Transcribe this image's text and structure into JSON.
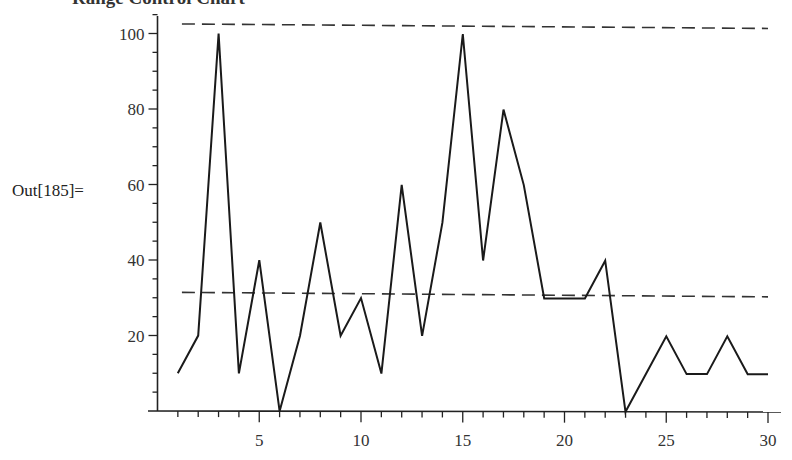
{
  "cell": {
    "output_label": "Out[185]=",
    "truncated_heading": "Range Control Chart"
  },
  "chart_data": {
    "type": "line",
    "title": "Range Control Chart",
    "xlabel": "",
    "ylabel": "",
    "x": [
      1,
      2,
      3,
      4,
      5,
      6,
      7,
      8,
      9,
      10,
      11,
      12,
      13,
      14,
      15,
      16,
      17,
      18,
      19,
      20,
      21,
      22,
      23,
      24,
      25,
      26,
      27,
      28,
      29,
      30
    ],
    "series": [
      {
        "name": "Range",
        "values": [
          10,
          20,
          100,
          10,
          40,
          0,
          20,
          50,
          20,
          30,
          10,
          60,
          20,
          50,
          100,
          40,
          80,
          60,
          30,
          30,
          30,
          40,
          0,
          10,
          20,
          10,
          10,
          20,
          10,
          10
        ],
        "style": "solid"
      }
    ],
    "reference_lines": [
      {
        "name": "Upper control limit",
        "value": 102.4,
        "style": "dashed"
      },
      {
        "name": "Center line (mean range)",
        "value": 31.3,
        "style": "dashed"
      }
    ],
    "xlim": [
      0,
      30.5
    ],
    "ylim": [
      0,
      105
    ],
    "x_ticks": [
      5,
      10,
      15,
      20,
      25,
      30
    ],
    "y_ticks": [
      20,
      40,
      60,
      80,
      100
    ],
    "grid": false,
    "legend": null,
    "colors": {
      "line": "#1a1a1a",
      "axis": "#222222",
      "dash": "#333333"
    }
  }
}
